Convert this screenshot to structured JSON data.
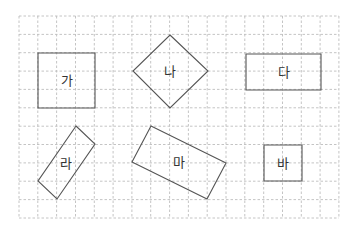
{
  "diagram": {
    "type": "grid-shapes",
    "grid": {
      "left": 19,
      "top": 16,
      "cols": 17,
      "rows": 11,
      "cell_w": 18.82,
      "cell_h": 18.36,
      "line_color": "#bdbdbd"
    },
    "shape_stroke": "#555555",
    "shapes": [
      {
        "label": "가",
        "kind": "square",
        "points": [
          [
            38,
            53
          ],
          [
            95,
            53
          ],
          [
            95,
            108
          ],
          [
            38,
            108
          ]
        ],
        "label_pos": [
          67,
          80
        ]
      },
      {
        "label": "나",
        "kind": "rotated-square",
        "points": [
          [
            170,
            35
          ],
          [
            208,
            71
          ],
          [
            170,
            108
          ],
          [
            133,
            71
          ]
        ],
        "label_pos": [
          170,
          71
        ]
      },
      {
        "label": "다",
        "kind": "rectangle",
        "points": [
          [
            246,
            54
          ],
          [
            321,
            54
          ],
          [
            321,
            90
          ],
          [
            246,
            90
          ]
        ],
        "label_pos": [
          284,
          72
        ]
      },
      {
        "label": "라",
        "kind": "rotated-rectangle",
        "points": [
          [
            76,
            126
          ],
          [
            95,
            144
          ],
          [
            57,
            199
          ],
          [
            38,
            181
          ]
        ],
        "label_pos": [
          66,
          163
        ]
      },
      {
        "label": "마",
        "kind": "rotated-rectangle",
        "points": [
          [
            151,
            126
          ],
          [
            226,
            163
          ],
          [
            207,
            199
          ],
          [
            132,
            162
          ]
        ],
        "label_pos": [
          179,
          162
        ]
      },
      {
        "label": "바",
        "kind": "square",
        "points": [
          [
            264,
            145
          ],
          [
            302,
            145
          ],
          [
            302,
            181
          ],
          [
            264,
            181
          ]
        ],
        "label_pos": [
          283,
          163
        ]
      }
    ]
  }
}
